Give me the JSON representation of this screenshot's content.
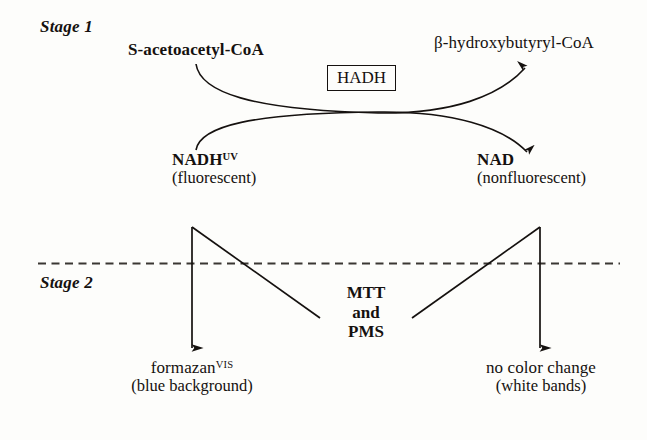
{
  "figure": {
    "type": "biochemical-reaction-scheme",
    "background_color": "#fdfdfb",
    "ink_color": "#15110f"
  },
  "stages": {
    "stage1_label": "Stage 1",
    "stage2_label": "Stage 2"
  },
  "stage1": {
    "substrate": "S-acetoacetyl-CoA",
    "product": "β-hydroxybutyryl-CoA",
    "enzyme_box": "HADH",
    "cofactor_in": {
      "name": "NADH",
      "superscript": "UV",
      "note": "(fluorescent)"
    },
    "cofactor_out": {
      "name": "NAD",
      "superscript": "",
      "note": "(nonfluorescent)"
    }
  },
  "stage2": {
    "reagents": [
      "MTT",
      "and",
      "PMS"
    ],
    "left_product": {
      "name": "formazan",
      "superscript": "VIS",
      "note": "(blue background)"
    },
    "right_product": {
      "name": "no color change",
      "superscript": "",
      "note": "(white bands)"
    }
  },
  "connectors": {
    "divider_style": "dashed",
    "curve_left_to_right_top": "S-acetoacetyl-CoA to β-hydroxybutyryl-CoA",
    "curve_left_to_right_bottom": "NADH to NAD",
    "vertical_left": "NADH down to formazan",
    "vertical_right": "NAD down to no color change",
    "diagonal_left": "NADH branch toward MTT and PMS",
    "diagonal_right": "MTT and PMS toward NAD branch"
  }
}
